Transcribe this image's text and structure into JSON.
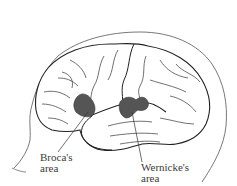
{
  "diagram": {
    "regions": [
      {
        "id": "broca",
        "label_line1": "Broca's",
        "label_line2": "area",
        "fill": "#555555"
      },
      {
        "id": "wernicke",
        "label_line1": "Wernicke's",
        "label_line2": "area",
        "fill": "#555555"
      }
    ],
    "colors": {
      "background": "#ffffff",
      "outline": "#222222",
      "sulci": "#333333",
      "region_fill": "#555555",
      "label_text": "#3a3a3a"
    }
  }
}
